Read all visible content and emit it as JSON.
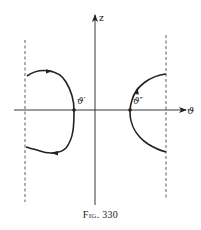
{
  "figure": {
    "caption": "Fig. 330",
    "axes": {
      "horizontal_label": "ϑ",
      "vertical_label": "z"
    },
    "points": [
      {
        "id": "theta-prime",
        "label": "ϑ′"
      },
      {
        "id": "theta-double-prime",
        "label": "ϑ″"
      }
    ],
    "curves": [
      {
        "id": "left-closed-trajectory",
        "direction": "clockwise from top-left, through ϑ′, back along bottom"
      },
      {
        "id": "right-open-trajectory",
        "direction": "upward through ϑ″"
      }
    ],
    "boundaries": [
      {
        "id": "left-dashed-boundary",
        "style": "dashed"
      },
      {
        "id": "right-dashed-boundary",
        "style": "dashed"
      }
    ],
    "colors": {
      "ink": "#222222",
      "background": "#ffffff"
    }
  }
}
